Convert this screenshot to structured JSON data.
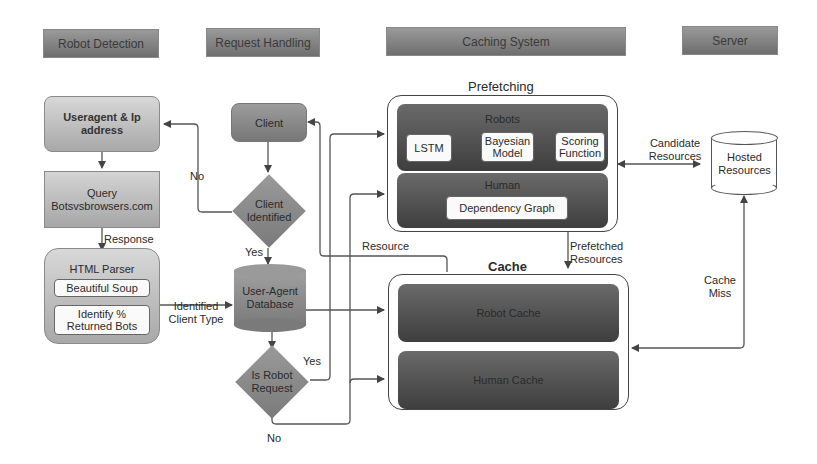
{
  "headers": {
    "robot_detection": "Robot Detection",
    "request_handling": "Request Handling",
    "caching_system": "Caching System",
    "server": "Server"
  },
  "robot_detection": {
    "useragent_ip": "Useragent & Ip address",
    "query": "Query Botsvsbrowsers.com",
    "response_label": "Response",
    "html_parser": {
      "title": "HTML Parser",
      "beautiful_soup": "Beautiful Soup",
      "identify": "Identify % Returned Bots"
    },
    "identified_client_type": "Identified Client Type"
  },
  "request_handling": {
    "client": "Client",
    "client_identified": "Client Identified",
    "no_label": "No",
    "yes_label": "Yes",
    "user_agent_db": "User-Agent Database",
    "is_robot_request": "Is Robot Request",
    "robot_yes": "Yes",
    "robot_no": "No",
    "resource_label": "Resource"
  },
  "caching_system": {
    "prefetching": {
      "title": "Prefetching",
      "robots": {
        "title": "Robots",
        "lstm": "LSTM",
        "bayesian": "Bayesian Model",
        "scoring": "Scoring Function"
      },
      "human": {
        "title": "Human",
        "dependency_graph": "Dependency Graph"
      }
    },
    "prefetched_resources": "Prefetched Resources",
    "cache": {
      "title": "Cache",
      "robot_cache": "Robot Cache",
      "human_cache": "Human Cache"
    }
  },
  "server": {
    "hosted_resources": "Hosted Resources",
    "candidate_resources": "Candidate Resources",
    "cache_miss": "Cache Miss"
  }
}
